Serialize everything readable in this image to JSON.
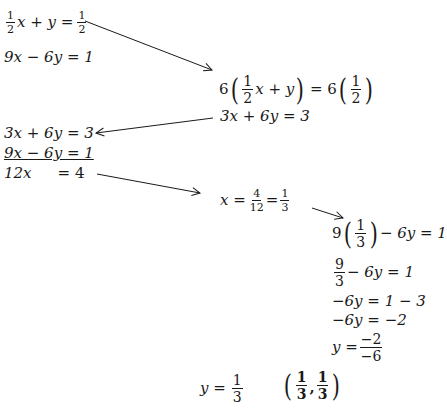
{
  "system": {
    "eq1": {
      "coef_num": "1",
      "coef_den": "2",
      "lhs_rest": "x + y =",
      "rhs_num": "1",
      "rhs_den": "2"
    },
    "eq2": "9x − 6y = 1"
  },
  "step_multiply": {
    "prefix": "6",
    "inner_num": "1",
    "inner_den": "2",
    "inner_rest": "x + y",
    "equals": "= 6",
    "rhs_num": "1",
    "rhs_den": "2",
    "result": "3x + 6y = 3"
  },
  "elimination": {
    "row1": "3x + 6y = 3",
    "row2": "9x − 6y = 1",
    "row3_lhs": "12x",
    "row3_rhs": "= 4"
  },
  "solve_x": {
    "lhs": "x =",
    "f1_num": "4",
    "f1_den": "12",
    "mid": "=",
    "f2_num": "1",
    "f2_den": "3"
  },
  "substitute": {
    "line1_prefix": "9",
    "line1_num": "1",
    "line1_den": "3",
    "line1_rest": "− 6y = 1",
    "line2_num": "9",
    "line2_den": "3",
    "line2_rest": "− 6y = 1",
    "line3": "−6y = 1 − 3",
    "line4": "−6y = −2",
    "line5_lhs": "y =",
    "line5_num": "−2",
    "line5_den": "−6"
  },
  "result": {
    "y_lhs": "y =",
    "y_num": "1",
    "y_den": "3",
    "point_x_num": "1",
    "point_x_den": "3",
    "point_sep": ",",
    "point_y_num": "1",
    "point_y_den": "3"
  },
  "arrows": [
    {
      "from": [
        85,
        21
      ],
      "to": [
        212,
        70
      ]
    },
    {
      "from": [
        213,
        118
      ],
      "to": [
        96,
        133
      ]
    },
    {
      "from": [
        97,
        174
      ],
      "to": [
        200,
        193
      ]
    },
    {
      "from": [
        312,
        208
      ],
      "to": [
        343,
        218
      ]
    }
  ]
}
